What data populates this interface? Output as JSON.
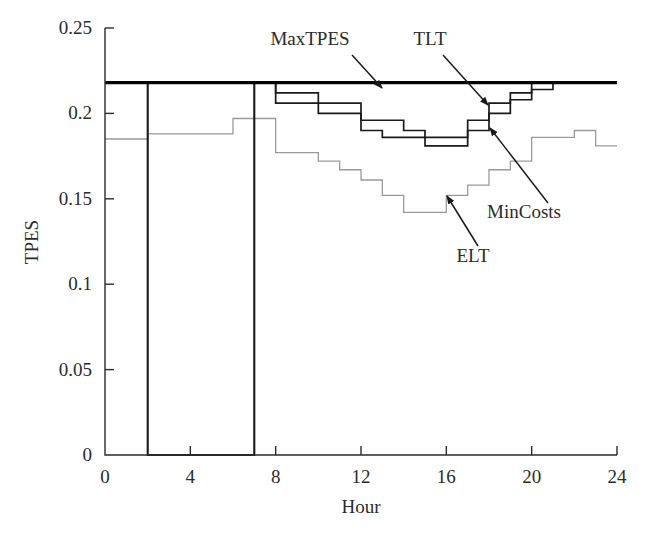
{
  "chart_data": {
    "type": "line",
    "subtype": "step",
    "title": "",
    "xlabel": "Hour",
    "ylabel": "TPES",
    "xlim": [
      0,
      24
    ],
    "ylim": [
      0,
      0.25
    ],
    "xticks": [
      0,
      4,
      8,
      12,
      16,
      20,
      24
    ],
    "xtick_labels": [
      "0",
      "4",
      "8",
      "12",
      "16",
      "20",
      "24"
    ],
    "yticks": [
      0,
      0.05,
      0.1,
      0.15,
      0.2,
      0.25
    ],
    "ytick_labels": [
      "0",
      "0.05",
      "0.1",
      "0.15",
      "0.2",
      "0.25"
    ],
    "grid": false,
    "legend_position": "annotations-with-arrows",
    "series": [
      {
        "name": "MaxTPES",
        "color": "#000000",
        "line_width": 3.2,
        "x": [
          0,
          24
        ],
        "values": [
          0.218,
          0.218
        ]
      },
      {
        "name": "TLT",
        "color": "#1a1a1a",
        "line_width": 1.7,
        "x": [
          0,
          1,
          2,
          2,
          3,
          4,
          5,
          6,
          7,
          7,
          8,
          9,
          10,
          11,
          12,
          13,
          14,
          15,
          16,
          17,
          18,
          19,
          20,
          21,
          22,
          23,
          24
        ],
        "values": [
          0.218,
          0.218,
          0.218,
          0.0,
          0.0,
          0.0,
          0.0,
          0.0,
          0.0,
          0.218,
          0.212,
          0.212,
          0.206,
          0.206,
          0.196,
          0.196,
          0.19,
          0.186,
          0.186,
          0.196,
          0.206,
          0.212,
          0.218,
          0.218,
          0.218,
          0.218,
          0.218
        ]
      },
      {
        "name": "MinCosts",
        "color": "#1a1a1a",
        "line_width": 1.7,
        "x": [
          0,
          1,
          2,
          2,
          3,
          4,
          5,
          6,
          7,
          7,
          8,
          9,
          10,
          11,
          12,
          13,
          14,
          15,
          16,
          17,
          18,
          19,
          20,
          21,
          22,
          23,
          24
        ],
        "values": [
          0.218,
          0.218,
          0.218,
          0.0,
          0.0,
          0.0,
          0.0,
          0.0,
          0.0,
          0.218,
          0.206,
          0.206,
          0.2,
          0.2,
          0.19,
          0.186,
          0.186,
          0.181,
          0.181,
          0.19,
          0.2,
          0.208,
          0.214,
          0.218,
          0.218,
          0.218,
          0.218
        ]
      },
      {
        "name": "ELT",
        "color": "#9a9a9a",
        "line_width": 1.3,
        "x": [
          0,
          1,
          2,
          3,
          4,
          5,
          6,
          7,
          8,
          9,
          10,
          11,
          12,
          13,
          14,
          15,
          16,
          17,
          18,
          19,
          20,
          21,
          22,
          23,
          24
        ],
        "values": [
          0.185,
          0.185,
          0.188,
          0.188,
          0.188,
          0.188,
          0.197,
          0.197,
          0.177,
          0.177,
          0.172,
          0.167,
          0.161,
          0.152,
          0.142,
          0.142,
          0.152,
          0.158,
          0.167,
          0.172,
          0.186,
          0.186,
          0.19,
          0.181,
          0.181
        ]
      }
    ],
    "annotations": [
      {
        "text": "MaxTPES",
        "label_x": 310,
        "label_y": 45,
        "arrow_from": [
          352,
          55
        ],
        "arrow_to": [
          382,
          88
        ]
      },
      {
        "text": "TLT",
        "label_x": 430,
        "label_y": 45,
        "arrow_from": [
          443,
          55
        ],
        "arrow_to": [
          488,
          105
        ]
      },
      {
        "text": "MinCosts",
        "label_x": 524,
        "label_y": 218,
        "arrow_from": [
          548,
          203
        ],
        "arrow_to": [
          490,
          128
        ]
      },
      {
        "text": "ELT",
        "label_x": 473,
        "label_y": 262,
        "arrow_from": [
          478,
          246
        ],
        "arrow_to": [
          447,
          196
        ]
      }
    ]
  },
  "axes": {
    "x_axis_title": "Hour",
    "y_axis_title": "TPES"
  }
}
